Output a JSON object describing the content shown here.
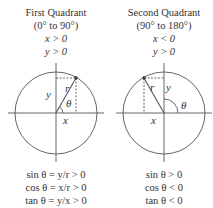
{
  "quadrants": [
    {
      "title": "First Quadrant",
      "range": "(0° to 90°)",
      "conditions": [
        "x > 0",
        "y > 0"
      ],
      "labels": {
        "r": "r",
        "x": "x",
        "y": "y",
        "theta": "θ"
      },
      "results": [
        "sin θ = y/r > 0",
        "cos θ = x/r > 0",
        "tan θ = y/x > 0"
      ]
    },
    {
      "title": "Second Quadrant",
      "range": "(90° to 180°)",
      "conditions": [
        "x < 0",
        "y > 0"
      ],
      "labels": {
        "r": "r",
        "x": "x",
        "y": "y",
        "theta": "θ"
      },
      "results": [
        "sin θ > 0",
        "cos θ < 0",
        "tan θ < 0"
      ]
    }
  ],
  "colors": {
    "line": "#555555",
    "text": "#333333"
  }
}
